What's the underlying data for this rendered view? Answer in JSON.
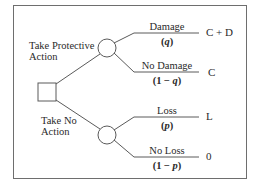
{
  "diagram": {
    "type": "decision-tree",
    "decision_node": {
      "shape": "square"
    },
    "actions": [
      {
        "label_line1": "Take Protective",
        "label_line2": "Action",
        "outcomes": [
          {
            "event": "Damage",
            "prob_open": "(",
            "prob_var": "q",
            "prob_close": ")",
            "result": "C + D"
          },
          {
            "event": "No Damage",
            "prob_open": "(1 − ",
            "prob_var": "q",
            "prob_close": ")",
            "result": "C"
          }
        ]
      },
      {
        "label_line1": "Take No",
        "label_line2": "Action",
        "outcomes": [
          {
            "event": "Loss",
            "prob_open": "(",
            "prob_var": "p",
            "prob_close": ")",
            "result": "L"
          },
          {
            "event": "No Loss",
            "prob_open": "(1 − ",
            "prob_var": "p",
            "prob_close": ")",
            "result": "0"
          }
        ]
      }
    ],
    "colors": {
      "line": "#5a5a5a",
      "frame": "#6e6e6e",
      "text": "#2a2a2a"
    }
  }
}
